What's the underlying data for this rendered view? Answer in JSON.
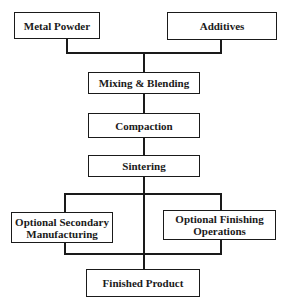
{
  "diagram": {
    "type": "flowchart",
    "nodes": [
      {
        "id": "metal_powder",
        "label": "Metal Powder"
      },
      {
        "id": "additives",
        "label": "Additives"
      },
      {
        "id": "mixing",
        "label": "Mixing & Blending"
      },
      {
        "id": "compaction",
        "label": "Compaction"
      },
      {
        "id": "sintering",
        "label": "Sintering"
      },
      {
        "id": "secondary",
        "label_line1": "Optional Secondary",
        "label_line2": "Manufacturing"
      },
      {
        "id": "finishing",
        "label_line1": "Optional Finishing",
        "label_line2": "Operations"
      },
      {
        "id": "finished",
        "label": "Finished Product"
      }
    ],
    "edges": [
      [
        "metal_powder",
        "mixing"
      ],
      [
        "additives",
        "mixing"
      ],
      [
        "mixing",
        "compaction"
      ],
      [
        "compaction",
        "sintering"
      ],
      [
        "sintering",
        "secondary"
      ],
      [
        "sintering",
        "finishing"
      ],
      [
        "sintering",
        "finished"
      ],
      [
        "secondary",
        "finished"
      ],
      [
        "finishing",
        "finished"
      ]
    ]
  }
}
